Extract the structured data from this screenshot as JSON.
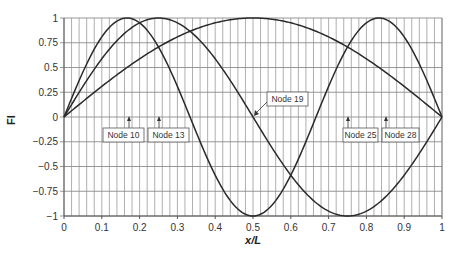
{
  "chart_data": {
    "type": "line",
    "title": "",
    "xlabel": "x/L",
    "ylabel": "FI",
    "xlim": [
      0,
      1
    ],
    "ylim": [
      -1,
      1
    ],
    "grid": true,
    "x_major_ticks": [
      "0",
      "0.1",
      "0.2",
      "0.3",
      "0.4",
      "0.5",
      "0.6",
      "0.7",
      "0.8",
      "0.9",
      "1"
    ],
    "y_major_ticks": [
      "1",
      "0.75",
      "0.5",
      "0.25",
      "0",
      "-0.25",
      "-0.5",
      "-0.75",
      "-1"
    ],
    "x_minor_step": 0.02,
    "legend": null,
    "series": [
      {
        "name": "Mode 1",
        "formula": "sin(pi*x)",
        "x": [
          0,
          0.1,
          0.2,
          0.3,
          0.4,
          0.5,
          0.6,
          0.7,
          0.8,
          0.9,
          1
        ],
        "values": [
          0,
          0.31,
          0.59,
          0.81,
          0.95,
          1,
          0.95,
          0.81,
          0.59,
          0.31,
          0
        ]
      },
      {
        "name": "Mode 2",
        "formula": "sin(2*pi*x)",
        "x": [
          0,
          0.1,
          0.2,
          0.25,
          0.3,
          0.4,
          0.5,
          0.6,
          0.7,
          0.75,
          0.8,
          0.9,
          1
        ],
        "values": [
          0,
          0.59,
          0.95,
          1,
          0.95,
          0.59,
          0,
          -0.59,
          -0.95,
          -1,
          -0.95,
          -0.59,
          0
        ]
      },
      {
        "name": "Mode 3",
        "formula": "sin(3*pi*x)",
        "x": [
          0,
          0.1,
          0.167,
          0.2,
          0.3,
          0.333,
          0.4,
          0.5,
          0.6,
          0.667,
          0.7,
          0.8,
          0.833,
          0.9,
          1
        ],
        "values": [
          0,
          0.81,
          1,
          0.95,
          0.31,
          0,
          -0.59,
          -1,
          -0.59,
          0,
          0.31,
          0.95,
          1,
          0.81,
          0
        ]
      }
    ],
    "annotations": [
      {
        "text": "Node 10",
        "x": 0.167
      },
      {
        "text": "Node 13",
        "x": 0.25
      },
      {
        "text": "Node 19",
        "x": 0.5
      },
      {
        "text": "Node 25",
        "x": 0.75
      },
      {
        "text": "Node 28",
        "x": 0.833
      }
    ]
  },
  "labels": {
    "xlabel": "x/L",
    "ylabel": "FI",
    "node10": "Node 10",
    "node13": "Node 13",
    "node19": "Node 19",
    "node25": "Node 25",
    "node28": "Node 28"
  },
  "colors": {
    "line": "#2a2a2a",
    "grid_major": "#8c8c8c",
    "grid_minor": "#9a9a9a"
  }
}
